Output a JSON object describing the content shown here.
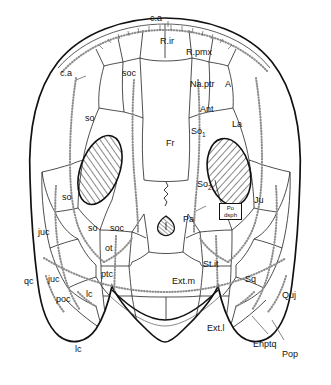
{
  "figure": {
    "type": "anatomical-diagram",
    "background_color": "#ffffff",
    "line_color": "#111111",
    "suture_color": "#222222",
    "canal_color": "#8a8a8a",
    "hatch_color": "#111111"
  },
  "labels": {
    "ca_top": "c.a",
    "ca_left": "c.a",
    "r_ir": "R.ir",
    "r_pmx": "R.pmx",
    "soc_top": "soc",
    "na_ptr": "Na.ptr",
    "a": "A",
    "ant": "Ant",
    "la": "La",
    "so_upper_left": "so",
    "so_lower_left": "so",
    "so_mid_left": "so",
    "soc_mid_left": "soc",
    "fr": "Fr",
    "so1_main": "So",
    "so1_sub": "1",
    "so2_main": "So",
    "so2_sub": "2",
    "pa": "Pa",
    "ju": "Ju",
    "po_dsph_line1": "Po",
    "po_dsph_line2": "dsph",
    "juc_upper": "juc",
    "juc_lower": "juc",
    "qc": "qc",
    "poc": "poc",
    "ot": "ot",
    "ptc": "ptc",
    "lc_upper": "lc",
    "lc_lower": "lc",
    "ext_m": "Ext.m",
    "ext_l": "Ext.l",
    "st_it": "St.it",
    "sq": "Sq",
    "quj": "Quj",
    "enptq": "Enptq",
    "pop": "Pop"
  }
}
